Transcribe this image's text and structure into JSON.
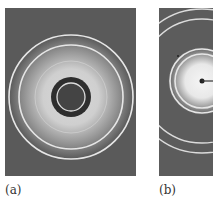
{
  "figure": {
    "panels": [
      {
        "label": "(a)",
        "description": "Powder ring diffraction pattern with dark beam-stop center",
        "center": [
          66,
          89
        ],
        "rings": [
          {
            "r": 62,
            "width": 1.6,
            "color": "#e6e6e6"
          },
          {
            "r": 52,
            "width": 1.6,
            "color": "#e6e6e6"
          },
          {
            "r": 14,
            "width": 1.3,
            "color": "#dddddd"
          }
        ],
        "halo_color": "#d6d6d6",
        "beamstop_radius": 20,
        "background": "#5a5a5a"
      },
      {
        "label": "(b)",
        "description": "Partial ring diffraction pattern with central diffuse spot and beam stop",
        "center": [
          43,
          73
        ],
        "rings": [
          {
            "r": 72,
            "width": 1.4,
            "color": "#dcdcdc"
          },
          {
            "r": 62,
            "width": 1.4,
            "color": "#dcdcdc"
          },
          {
            "r": 32,
            "width": 1.6,
            "color": "#e6e6e6"
          },
          {
            "r": 27,
            "width": 1.6,
            "color": "#e6e6e6"
          }
        ],
        "halo_color": "#f2f2f2",
        "background": "#5c5c5c"
      }
    ]
  }
}
